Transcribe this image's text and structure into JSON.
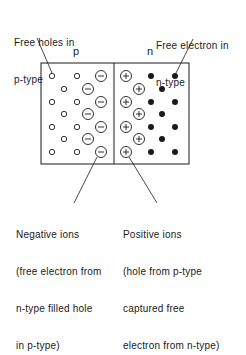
{
  "labels": {
    "free_holes": [
      "Free holes in",
      "p-type"
    ],
    "free_electron": [
      "Free electron in",
      "n-type"
    ],
    "region_p": "p",
    "region_n": "n",
    "negative_ions": [
      "Negative ions",
      "(free electron from",
      "n-type filled hole",
      "in p-type)"
    ],
    "positive_ions": [
      "Positive ions",
      "(hole from p-type",
      "captured free",
      "electron from n-type)"
    ]
  },
  "symbols": {
    "hole": "small-open-circle",
    "negative_ion": "circled-minus",
    "positive_ion": "circled-plus",
    "electron": "filled-dot"
  },
  "colors": {
    "ink": "#1a1a1a",
    "background": "#ffffff"
  }
}
